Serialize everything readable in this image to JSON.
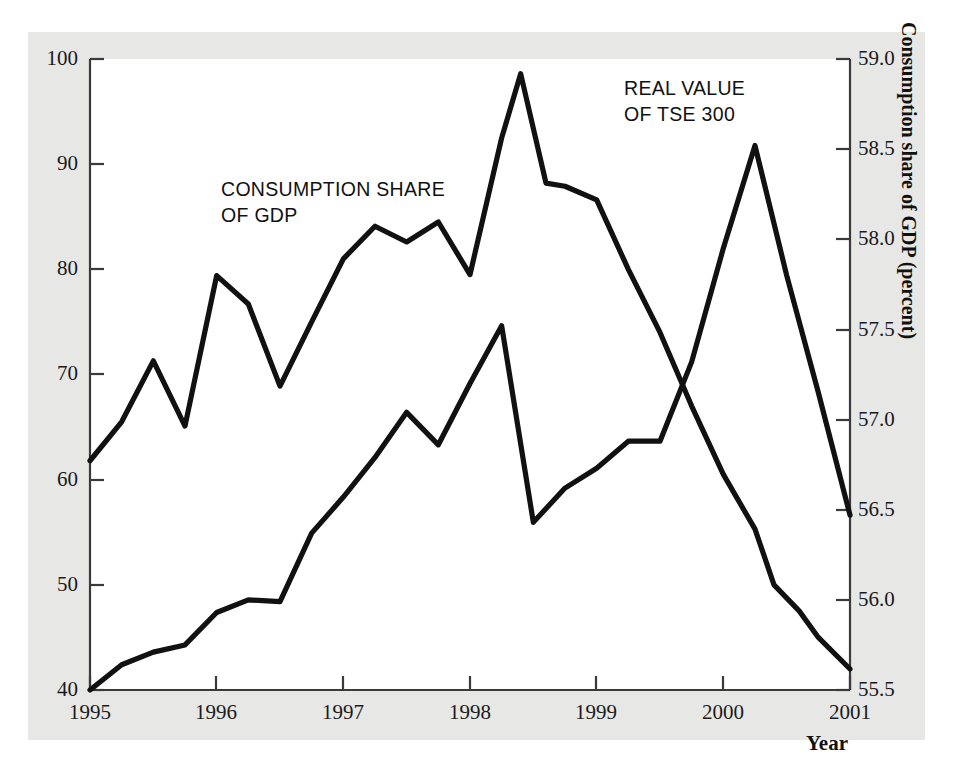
{
  "figure": {
    "background_color": "#e7e7e5",
    "plot_background_color": "#ffffff",
    "line_color": "#111111"
  },
  "axis_titles": {
    "left": "Stock market index",
    "right": "Consumption share of GDP (percent)",
    "x": "Year"
  },
  "annotations": {
    "consumption": "CONSUMPTION SHARE\nOF GDP",
    "tse": "REAL VALUE\nOF TSE 300"
  },
  "ticks": {
    "left": [
      "100",
      "90",
      "80",
      "70",
      "60",
      "50",
      "40"
    ],
    "right": [
      "59.0",
      "58.5",
      "58.0",
      "57.5",
      "57.0",
      "56.5",
      "56.0",
      "55.5"
    ],
    "x": [
      "1995",
      "1996",
      "1997",
      "1998",
      "1999",
      "2000",
      "2001"
    ]
  },
  "chart_data": {
    "type": "line",
    "title": "",
    "xlabel": "Year",
    "ylabel": "Stock market index",
    "y2label": "Consumption share of GDP (percent)",
    "xlim": [
      1995.0,
      2001.0
    ],
    "ylim": [
      40,
      100
    ],
    "y2lim": [
      55.5,
      59.0
    ],
    "grid": false,
    "legend": "inline-annotations",
    "series": [
      {
        "name": "REAL VALUE OF TSE 300",
        "axis": "left",
        "units": "index",
        "x": [
          1995.0,
          1995.25,
          1995.5,
          1995.75,
          1996.0,
          1996.25,
          1996.5,
          1996.75,
          1997.0,
          1997.25,
          1997.5,
          1997.75,
          1998.0,
          1998.25,
          1998.4,
          1998.6,
          1998.75,
          1999.0,
          1999.25,
          1999.5,
          1999.75,
          2000.0,
          2000.25,
          2000.4,
          2000.6,
          2000.75,
          2001.0
        ],
        "values": [
          61.8,
          65.5,
          71.3,
          65.1,
          79.4,
          76.7,
          68.9,
          75.0,
          81.0,
          84.1,
          82.6,
          84.5,
          79.5,
          92.5,
          98.6,
          88.2,
          87.9,
          86.6,
          80.0,
          74.0,
          67.0,
          60.5,
          55.3,
          50.0,
          47.5,
          45.0,
          42.0
        ]
      },
      {
        "name": "CONSUMPTION SHARE OF GDP",
        "axis": "right",
        "units": "percent",
        "x": [
          1995.0,
          1995.25,
          1995.5,
          1995.75,
          1996.0,
          1996.25,
          1996.5,
          1996.75,
          1997.0,
          1997.25,
          1997.5,
          1997.75,
          1998.0,
          1998.25,
          1998.5,
          1998.75,
          1999.0,
          1999.25,
          1999.5,
          1999.75,
          2000.0,
          2000.25,
          2000.5,
          2000.75,
          2001.0
        ],
        "values": [
          55.5,
          55.64,
          55.71,
          55.75,
          55.93,
          56.0,
          55.99,
          56.37,
          56.57,
          56.79,
          57.04,
          56.86,
          57.2,
          57.52,
          56.43,
          56.62,
          56.73,
          56.88,
          56.88,
          57.32,
          57.95,
          58.52,
          57.8,
          57.15,
          56.47
        ],
        "values_on_left_scale": [
          40.0,
          42.4,
          43.6,
          44.3,
          47.4,
          48.6,
          48.4,
          54.9,
          58.3,
          62.1,
          66.4,
          63.3,
          69.1,
          74.6,
          55.9,
          59.1,
          61.0,
          63.5,
          63.5,
          71.1,
          81.9,
          91.7,
          79.3,
          68.1,
          56.6
        ]
      }
    ]
  }
}
